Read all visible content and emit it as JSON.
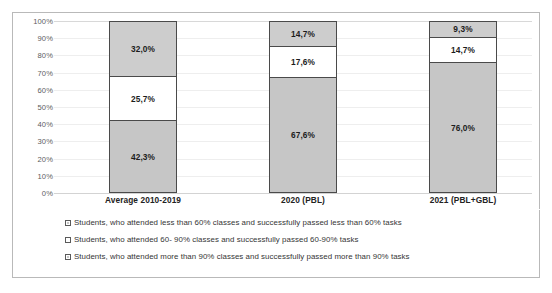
{
  "chart_data": {
    "type": "bar",
    "stacked": true,
    "title": "",
    "xlabel": "",
    "ylabel": "",
    "ylim": [
      0,
      100
    ],
    "grid": true,
    "legend_position": "bottom",
    "categories": [
      "Average 2010-2019",
      "2020 (PBL)",
      "2021 (PBL+GBL)"
    ],
    "y_ticks": [
      "0%",
      "10%",
      "20%",
      "30%",
      "40%",
      "50%",
      "60%",
      "70%",
      "80%",
      "90%",
      "100%"
    ],
    "y_tick_values": [
      0,
      10,
      20,
      30,
      40,
      50,
      60,
      70,
      80,
      90,
      100
    ],
    "series": [
      {
        "name": "Students, who attended more than 90% classes and successfully passed more than 90% tasks",
        "legend_marker": "dark",
        "stack_order": "bottom",
        "values": [
          42.3,
          67.6,
          76.0
        ],
        "labels": [
          "42,3%",
          "67,6%",
          "76,0%"
        ],
        "color": "#c6c6c6"
      },
      {
        "name": "Students, who attended 60- 90% classes and successfully passed 60-90% tasks",
        "legend_marker": "light",
        "stack_order": "middle",
        "values": [
          25.7,
          17.6,
          14.7
        ],
        "labels": [
          "25,7%",
          "17,6%",
          "14,7%"
        ],
        "color": "#ffffff"
      },
      {
        "name": "Students, who attended less than 60% classes and successfully passed less than 60% tasks",
        "legend_marker": "dark",
        "stack_order": "top",
        "values": [
          32.0,
          14.7,
          9.3
        ],
        "labels": [
          "32,0%",
          "14,7%",
          "9,3%"
        ],
        "color": "#cdcdcd"
      }
    ],
    "bars": [
      {
        "category": "Average 2010-2019",
        "segments": [
          {
            "label": "32,0%",
            "value": 32.0,
            "style": "mid"
          },
          {
            "label": "25,7%",
            "value": 25.7,
            "style": "light"
          },
          {
            "label": "42,3%",
            "value": 42.3,
            "style": "dark"
          }
        ]
      },
      {
        "category": "2020 (PBL)",
        "segments": [
          {
            "label": "14,7%",
            "value": 14.7,
            "style": "mid"
          },
          {
            "label": "17,6%",
            "value": 17.6,
            "style": "light"
          },
          {
            "label": "67,6%",
            "value": 67.6,
            "style": "dark"
          }
        ]
      },
      {
        "category": "2021 (PBL+GBL)",
        "segments": [
          {
            "label": "9,3%",
            "value": 9.3,
            "style": "mid"
          },
          {
            "label": "14,7%",
            "value": 14.7,
            "style": "light"
          },
          {
            "label": "76,0%",
            "value": 76.0,
            "style": "dark"
          }
        ]
      }
    ],
    "legend": [
      {
        "marker": "dark",
        "text": "Students, who attended less than 60% classes and successfully passed less than 60% tasks"
      },
      {
        "marker": "light",
        "text": "Students, who attended 60- 90% classes and successfully passed 60-90% tasks"
      },
      {
        "marker": "dark",
        "text": "Students, who attended more than 90% classes and successfully passed more than 90% tasks"
      }
    ],
    "colors": {
      "segment_top": "#cdcdcd",
      "segment_middle": "#ffffff",
      "segment_bottom": "#c6c6c6",
      "segment_border": "#4a4a4a",
      "gridline": "#eeeeee",
      "frame": "#b9b9b9",
      "tick_text": "#5d5d5d",
      "label_text": "#1c1c1c",
      "legend_text": "#353535"
    }
  }
}
